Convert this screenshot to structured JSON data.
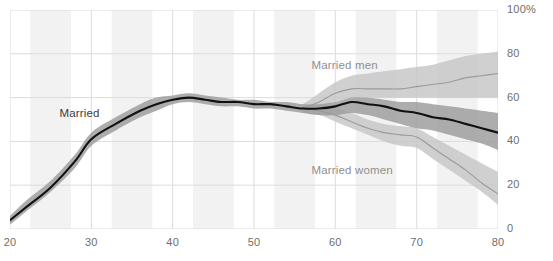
{
  "chart_data": {
    "type": "line",
    "title": "",
    "xlabel": "",
    "ylabel": "",
    "xlim": [
      20,
      80
    ],
    "ylim": [
      0,
      100
    ],
    "grid": true,
    "legend_position": "inline-annotations",
    "x_ticks": [
      "20",
      "30",
      "40",
      "50",
      "60",
      "70",
      "80"
    ],
    "x_tick_values": [
      20,
      30,
      40,
      50,
      60,
      70,
      80
    ],
    "y_ticks": [
      "0",
      "20",
      "40",
      "60",
      "80",
      "100%"
    ],
    "y_tick_values": [
      0,
      20,
      40,
      60,
      80,
      100
    ],
    "annotations": [
      {
        "text": "Married",
        "x": 31,
        "y": 52
      },
      {
        "text": "Married men",
        "x": 62,
        "y": 74
      },
      {
        "text": "Married women",
        "x": 62,
        "y": 26
      }
    ],
    "series": [
      {
        "name": "Married",
        "color": "#111111",
        "band_color": "#9b9b9b",
        "x": [
          20,
          22,
          25,
          28,
          30,
          33,
          36,
          38,
          40,
          42,
          44,
          46,
          48,
          50,
          52,
          54,
          56,
          58,
          60,
          62,
          64,
          66,
          68,
          70,
          72,
          74,
          76,
          78,
          80
        ],
        "values": [
          4,
          10,
          19,
          31,
          41,
          48,
          54,
          57,
          59,
          60,
          59,
          58,
          58,
          57,
          57,
          56,
          55,
          55,
          56,
          58,
          57,
          56,
          54,
          53,
          51,
          50,
          48,
          46,
          44
        ],
        "band_low": [
          2,
          8,
          17,
          28,
          38,
          45,
          51,
          54,
          57,
          58,
          57,
          56,
          56,
          55,
          55,
          54,
          53,
          52,
          52,
          53,
          52,
          50,
          48,
          46,
          45,
          43,
          41,
          39,
          36
        ],
        "band_high": [
          6,
          13,
          22,
          34,
          44,
          51,
          57,
          60,
          61,
          62,
          61,
          60,
          59,
          59,
          58,
          58,
          57,
          57,
          58,
          60,
          60,
          59,
          58,
          58,
          57,
          56,
          55,
          54,
          53
        ]
      },
      {
        "name": "Married men",
        "color": "#9a9a9a",
        "band_color": "#c6c6c6",
        "x": [
          56,
          58,
          60,
          62,
          64,
          66,
          68,
          70,
          72,
          74,
          76,
          78,
          80
        ],
        "values": [
          55,
          58,
          62,
          64,
          64,
          64,
          64,
          65,
          66,
          67,
          69,
          70,
          71
        ],
        "band_low": [
          53,
          55,
          58,
          60,
          60,
          60,
          60,
          60,
          60,
          60,
          60,
          60,
          60
        ],
        "band_high": [
          57,
          62,
          67,
          70,
          71,
          72,
          73,
          74,
          75,
          77,
          79,
          80,
          81
        ]
      },
      {
        "name": "Married women",
        "color": "#9a9a9a",
        "band_color": "#c6c6c6",
        "x": [
          56,
          58,
          60,
          62,
          64,
          66,
          68,
          70,
          72,
          74,
          76,
          78,
          80
        ],
        "values": [
          55,
          54,
          52,
          49,
          46,
          44,
          43,
          42,
          37,
          32,
          27,
          21,
          16
        ],
        "band_low": [
          53,
          52,
          49,
          46,
          43,
          40,
          38,
          37,
          32,
          27,
          22,
          17,
          11
        ],
        "band_high": [
          57,
          57,
          55,
          53,
          50,
          48,
          47,
          46,
          42,
          38,
          34,
          30,
          26
        ]
      }
    ],
    "background_bands": [
      {
        "from": 22.5,
        "to": 27.5
      },
      {
        "from": 32.5,
        "to": 37.5
      },
      {
        "from": 42.5,
        "to": 47.5
      },
      {
        "from": 52.5,
        "to": 57.5
      },
      {
        "from": 62.5,
        "to": 67.5
      },
      {
        "from": 72.5,
        "to": 77.5
      }
    ],
    "colors": {
      "grid": "#dcdcdc",
      "band_background": "#f2f2f2",
      "axis_text": "#6e6e6e",
      "married_line": "#111111",
      "married_band": "#9b9b9b",
      "sex_line": "#9a9a9a",
      "sex_band": "#c6c6c6",
      "plot_background": "#ffffff"
    },
    "partial_cropped_title": ""
  }
}
